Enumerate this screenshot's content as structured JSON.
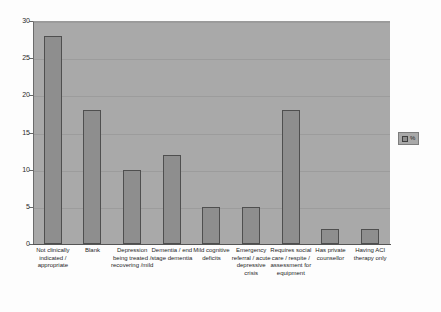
{
  "chart_data": {
    "type": "bar",
    "title": "",
    "xlabel": "",
    "ylabel": "",
    "ylim": [
      0,
      30
    ],
    "ytick_step": 5,
    "ytick_labels": [
      "0",
      "5",
      "10",
      "15",
      "20",
      "25",
      "30"
    ],
    "grid": true,
    "legend_position": "right",
    "categories": [
      "Not clinically indicated / appropriate",
      "Blank",
      "Depression being treated / recovering /mild",
      "Dementia / end stage dementia",
      "Mild cognitive deficits",
      "Emergency referral / acute depressive crisis",
      "Requires social care / respite / assessment for equipment",
      "Has private counsellor",
      "Having ACI therapy only"
    ],
    "values": [
      28,
      18,
      10,
      12,
      5,
      5,
      18,
      2,
      2
    ],
    "series": [
      {
        "name": "%",
        "values": [
          28,
          18,
          10,
          12,
          5,
          5,
          18,
          2,
          2
        ]
      }
    ],
    "legend": [
      "%"
    ]
  },
  "colors": {
    "plot_background": "#a9a9a9",
    "bar_fill": "#8e8e8e",
    "bar_border": "#4f4f4f",
    "gridline": "#9c9c9c",
    "axis": "#555555",
    "page_background": "#fdfdfd",
    "text": "#1f1f1f"
  },
  "legend": {
    "label": "%"
  }
}
